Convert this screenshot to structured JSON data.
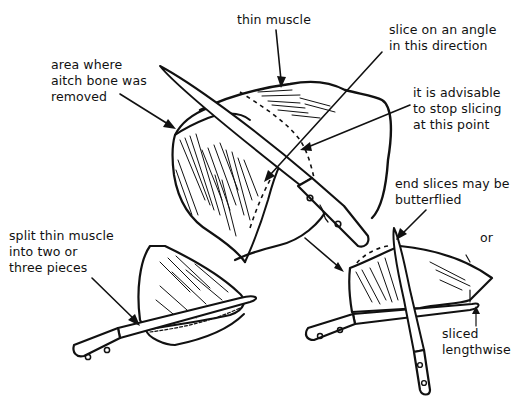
{
  "diagram": {
    "colors": {
      "ink": "#111111",
      "background": "#ffffff"
    },
    "labels": {
      "thin_muscle": "thin muscle",
      "slice_angle": "slice on an angle\nin this direction",
      "aitch_bone": "area where\naitch bone was\nremoved",
      "stop_slicing": "it is advisable\nto stop slicing\nat this point",
      "split_muscle": "split thin muscle\ninto two or\nthree pieces",
      "end_slices": "end slices may be\nbutterflied",
      "or": "or",
      "sliced_lengthwise": "sliced\nlengthwise"
    },
    "figures": [
      {
        "name": "main-roast",
        "description": "roast with carving knife showing slicing angle"
      },
      {
        "name": "thin-muscle-piece",
        "description": "thin muscle piece split with knife"
      },
      {
        "name": "butterflied-slice",
        "description": "end slice butterflied with crossed knives"
      },
      {
        "name": "lengthwise-slice",
        "description": "end slice sliced lengthwise"
      }
    ]
  }
}
